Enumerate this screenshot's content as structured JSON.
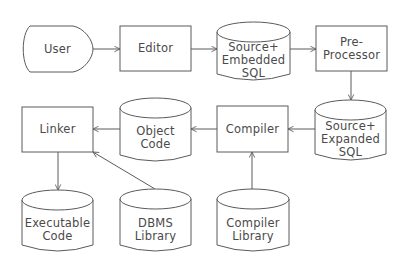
{
  "diagram": {
    "type": "flowchart",
    "title": "",
    "colors": {
      "stroke": "#5a5a5a",
      "text": "#4a4a4a",
      "background": "#ffffff"
    },
    "nodes": [
      {
        "id": "user",
        "shape": "terminal",
        "lines": [
          "User"
        ]
      },
      {
        "id": "editor",
        "shape": "process",
        "lines": [
          "Editor"
        ]
      },
      {
        "id": "source_embedded",
        "shape": "cylinder",
        "lines": [
          "Source+",
          "Embedded",
          "SQL"
        ]
      },
      {
        "id": "preprocessor",
        "shape": "process",
        "lines": [
          "Pre-",
          "Processor"
        ]
      },
      {
        "id": "source_expanded",
        "shape": "cylinder",
        "lines": [
          "Source+",
          "Expanded",
          "SQL"
        ]
      },
      {
        "id": "compiler",
        "shape": "process",
        "lines": [
          "Compiler"
        ]
      },
      {
        "id": "object_code",
        "shape": "cylinder",
        "lines": [
          "Object",
          "Code"
        ]
      },
      {
        "id": "linker",
        "shape": "process",
        "lines": [
          "Linker"
        ]
      },
      {
        "id": "executable",
        "shape": "cylinder",
        "lines": [
          "Executable",
          "Code"
        ]
      },
      {
        "id": "dbms_library",
        "shape": "cylinder",
        "lines": [
          "DBMS",
          "Library"
        ]
      },
      {
        "id": "compiler_library",
        "shape": "cylinder",
        "lines": [
          "Compiler",
          "Library"
        ]
      }
    ],
    "edges": [
      {
        "from": "user",
        "to": "editor"
      },
      {
        "from": "editor",
        "to": "source_embedded"
      },
      {
        "from": "source_embedded",
        "to": "preprocessor"
      },
      {
        "from": "preprocessor",
        "to": "source_expanded"
      },
      {
        "from": "source_expanded",
        "to": "compiler"
      },
      {
        "from": "compiler",
        "to": "object_code"
      },
      {
        "from": "object_code",
        "to": "linker"
      },
      {
        "from": "linker",
        "to": "executable"
      },
      {
        "from": "dbms_library",
        "to": "linker"
      },
      {
        "from": "compiler_library",
        "to": "compiler"
      }
    ]
  }
}
